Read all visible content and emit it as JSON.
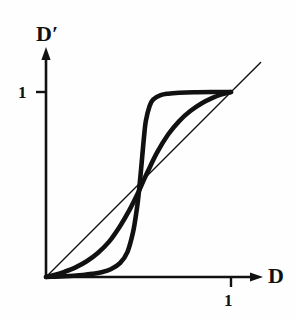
{
  "figure": {
    "background_color": "#fefefe",
    "ink_color": "#111111"
  },
  "axes": {
    "y_title": "D",
    "y_title_prime": "′",
    "x_title": "D",
    "y_tick_label": "1",
    "x_tick_label": "1"
  },
  "chart_data": {
    "type": "line",
    "title": "",
    "xlabel": "D",
    "ylabel": "D′",
    "xlim": [
      0,
      1.1
    ],
    "ylim": [
      0,
      1.12
    ],
    "grid": false,
    "legend": null,
    "x_ticks": [
      1
    ],
    "x_tick_labels": [
      "1"
    ],
    "y_ticks": [
      1
    ],
    "y_tick_labels": [
      "1"
    ],
    "axis_arrows": {
      "x": true,
      "y": true
    },
    "series": [
      {
        "name": "identity-line",
        "style": "thin-straight",
        "stroke_width": 1.4,
        "x": [
          0.0,
          1.0,
          1.16
        ],
        "values": [
          0.0,
          1.0,
          1.16
        ]
      },
      {
        "name": "steep-sigmoid",
        "style": "thick-curve",
        "stroke_width": 4.6,
        "midpoint_x": 0.52,
        "x": [
          0.0,
          0.05,
          0.1,
          0.15,
          0.2,
          0.25,
          0.3,
          0.35,
          0.4,
          0.44,
          0.47,
          0.49,
          0.5,
          0.51,
          0.52,
          0.53,
          0.54,
          0.56,
          0.58,
          0.62,
          0.66,
          0.72,
          0.8,
          0.9,
          1.0
        ],
        "values": [
          0.0,
          0.002,
          0.004,
          0.007,
          0.011,
          0.017,
          0.026,
          0.042,
          0.075,
          0.135,
          0.24,
          0.36,
          0.44,
          0.54,
          0.65,
          0.76,
          0.845,
          0.925,
          0.96,
          0.983,
          0.991,
          0.996,
          0.999,
          1.0,
          1.0
        ]
      },
      {
        "name": "gradual-sigmoid",
        "style": "thick-curve",
        "stroke_width": 4.6,
        "midpoint_x": 0.52,
        "x": [
          0.0,
          0.05,
          0.1,
          0.16,
          0.22,
          0.28,
          0.34,
          0.4,
          0.45,
          0.5,
          0.52,
          0.55,
          0.6,
          0.66,
          0.72,
          0.78,
          0.84,
          0.9,
          0.95,
          1.0
        ],
        "values": [
          0.0,
          0.012,
          0.028,
          0.052,
          0.085,
          0.13,
          0.19,
          0.275,
          0.36,
          0.46,
          0.505,
          0.57,
          0.672,
          0.77,
          0.843,
          0.897,
          0.938,
          0.968,
          0.987,
          1.0
        ]
      }
    ]
  }
}
